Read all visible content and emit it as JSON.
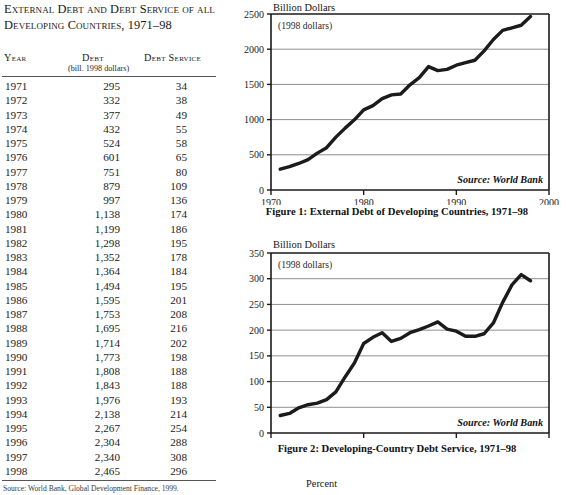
{
  "table": {
    "title": "External Debt and Debt Service of all Developing Countries, 1971–98",
    "headers": {
      "year": "Year",
      "debt": "Debt",
      "debt_service": "Debt Service",
      "units": "(bill. 1998 dollars)"
    },
    "rows": [
      {
        "year": "1971",
        "debt": "295",
        "service": "34"
      },
      {
        "year": "1972",
        "debt": "332",
        "service": "38"
      },
      {
        "year": "1973",
        "debt": "377",
        "service": "49"
      },
      {
        "year": "1974",
        "debt": "432",
        "service": "55"
      },
      {
        "year": "1975",
        "debt": "524",
        "service": "58"
      },
      {
        "year": "1976",
        "debt": "601",
        "service": "65"
      },
      {
        "year": "1977",
        "debt": "751",
        "service": "80"
      },
      {
        "year": "1978",
        "debt": "879",
        "service": "109"
      },
      {
        "year": "1979",
        "debt": "997",
        "service": "136"
      },
      {
        "year": "1980",
        "debt": "1,138",
        "service": "174"
      },
      {
        "year": "1981",
        "debt": "1,199",
        "service": "186"
      },
      {
        "year": "1982",
        "debt": "1,298",
        "service": "195"
      },
      {
        "year": "1983",
        "debt": "1,352",
        "service": "178"
      },
      {
        "year": "1984",
        "debt": "1,364",
        "service": "184"
      },
      {
        "year": "1985",
        "debt": "1,494",
        "service": "195"
      },
      {
        "year": "1986",
        "debt": "1,595",
        "service": "201"
      },
      {
        "year": "1987",
        "debt": "1,753",
        "service": "208"
      },
      {
        "year": "1988",
        "debt": "1,695",
        "service": "216"
      },
      {
        "year": "1989",
        "debt": "1,714",
        "service": "202"
      },
      {
        "year": "1990",
        "debt": "1,773",
        "service": "198"
      },
      {
        "year": "1991",
        "debt": "1,808",
        "service": "188"
      },
      {
        "year": "1992",
        "debt": "1,843",
        "service": "188"
      },
      {
        "year": "1993",
        "debt": "1,976",
        "service": "193"
      },
      {
        "year": "1994",
        "debt": "2,138",
        "service": "214"
      },
      {
        "year": "1995",
        "debt": "2,267",
        "service": "254"
      },
      {
        "year": "1996",
        "debt": "2,304",
        "service": "288"
      },
      {
        "year": "1997",
        "debt": "2,340",
        "service": "308"
      },
      {
        "year": "1998",
        "debt": "2,465",
        "service": "296"
      }
    ],
    "source": "Source: World Bank, Global Development Finance, 1999."
  },
  "figures": {
    "percent_label": "Percent",
    "fig1": {
      "caption": "Figure 1: External Debt of Developing Countries, 1971–98",
      "axis_title": "Billion Dollars",
      "unit_note": "(1998 dollars)",
      "source": "Source: World Bank"
    },
    "fig2": {
      "caption": "Figure 2: Developing-Country Debt Service, 1971–98",
      "axis_title": "Billion Dollars",
      "unit_note": "(1998 dollars)",
      "source": "Source: World Bank"
    }
  },
  "chart_data": [
    {
      "type": "line",
      "title": "Figure 1: External Debt of Developing Countries, 1971–98",
      "xlabel": "",
      "ylabel": "Billion Dollars",
      "annotation": "(1998 dollars)",
      "source": "Source: World Bank",
      "xlim": [
        1970,
        2000
      ],
      "ylim": [
        0,
        2500
      ],
      "xticks": [
        1970,
        1980,
        1990,
        2000
      ],
      "yticks": [
        0,
        500,
        1000,
        1500,
        2000,
        2500
      ],
      "grid": true,
      "legend": "none",
      "x": [
        1971,
        1972,
        1973,
        1974,
        1975,
        1976,
        1977,
        1978,
        1979,
        1980,
        1981,
        1982,
        1983,
        1984,
        1985,
        1986,
        1987,
        1988,
        1989,
        1990,
        1991,
        1992,
        1993,
        1994,
        1995,
        1996,
        1997,
        1998
      ],
      "values": [
        295,
        332,
        377,
        432,
        524,
        601,
        751,
        879,
        997,
        1138,
        1199,
        1298,
        1352,
        1364,
        1494,
        1595,
        1753,
        1695,
        1714,
        1773,
        1808,
        1843,
        1976,
        2138,
        2267,
        2304,
        2340,
        2465
      ]
    },
    {
      "type": "line",
      "title": "Figure 2: Developing-Country Debt Service, 1971–98",
      "xlabel": "",
      "ylabel": "Billion Dollars",
      "annotation": "(1998 dollars)",
      "source": "Source: World Bank",
      "xlim": [
        1970,
        2000
      ],
      "ylim": [
        0,
        350
      ],
      "xticks": [
        1970,
        1980,
        1990,
        2000
      ],
      "yticks": [
        0,
        50,
        100,
        150,
        200,
        250,
        300,
        350
      ],
      "grid": true,
      "legend": "none",
      "x": [
        1971,
        1972,
        1973,
        1974,
        1975,
        1976,
        1977,
        1978,
        1979,
        1980,
        1981,
        1982,
        1983,
        1984,
        1985,
        1986,
        1987,
        1988,
        1989,
        1990,
        1991,
        1992,
        1993,
        1994,
        1995,
        1996,
        1997,
        1998
      ],
      "values": [
        34,
        38,
        49,
        55,
        58,
        65,
        80,
        109,
        136,
        174,
        186,
        195,
        178,
        184,
        195,
        201,
        208,
        216,
        202,
        198,
        188,
        188,
        193,
        214,
        254,
        288,
        308,
        296
      ]
    }
  ]
}
